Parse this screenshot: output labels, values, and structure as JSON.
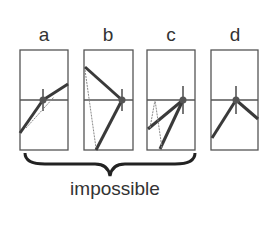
{
  "panels": [
    {
      "id": "a",
      "label": "a",
      "x": 20,
      "possible": false
    },
    {
      "id": "b",
      "label": "b",
      "x": 84,
      "possible": false
    },
    {
      "id": "c",
      "label": "c",
      "x": 147,
      "possible": false
    },
    {
      "id": "d",
      "label": "d",
      "x": 211,
      "possible": true
    }
  ],
  "brace": {
    "spans": [
      "a",
      "b",
      "c"
    ],
    "caption": "impossible"
  },
  "colors": {
    "stroke": "#444444",
    "line": "#3a3a3a",
    "dotted": "#777777",
    "text": "#333333"
  }
}
